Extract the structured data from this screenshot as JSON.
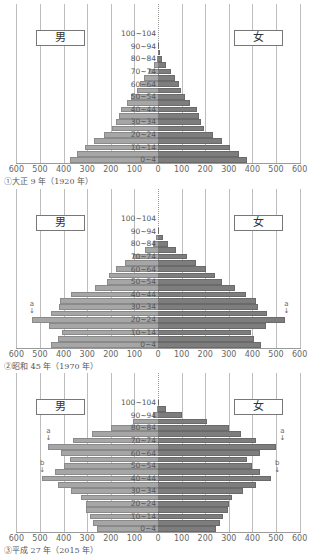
{
  "chart_data": [
    {
      "type": "bar",
      "subtype": "population-pyramid",
      "title": "①大正9年（1920年）",
      "unit": "万人 (implied, 10 thousand persons)",
      "xlabel": "",
      "ylabel": "",
      "x_ticks": [
        600,
        500,
        400,
        300,
        200,
        100,
        0,
        100,
        200,
        300,
        400,
        500,
        600
      ],
      "xlim": [
        -600,
        600
      ],
      "age_labels_shown": [
        "100~104",
        "90~94",
        "80~84",
        "70~74",
        "60~64",
        "50~54",
        "40~44",
        "30~34",
        "20~24",
        "10~14",
        "0~4"
      ],
      "categories": [
        "0~4",
        "5~9",
        "10~14",
        "15~19",
        "20~24",
        "25~29",
        "30~34",
        "35~39",
        "40~44",
        "45~49",
        "50~54",
        "55~59",
        "60~64",
        "65~69",
        "70~74",
        "75~79",
        "80~84",
        "85~89",
        "90~94",
        "95~99",
        "100~104"
      ],
      "series": [
        {
          "name": "男",
          "color": "#a6a6a6",
          "values": [
            373,
            343,
            309,
            271,
            229,
            195,
            178,
            165,
            157,
            131,
            114,
            89,
            76,
            59,
            38,
            17,
            6,
            2,
            0,
            0,
            0
          ]
        },
        {
          "name": "女",
          "color": "#7d7d7d",
          "values": [
            377,
            343,
            305,
            271,
            233,
            195,
            182,
            174,
            165,
            136,
            114,
            97,
            89,
            72,
            55,
            34,
            17,
            8,
            2,
            0,
            0
          ]
        }
      ],
      "legend": [
        "男",
        "女"
      ],
      "annotations": []
    },
    {
      "type": "bar",
      "subtype": "population-pyramid",
      "title": "②昭和45年（1970年）",
      "x_ticks": [
        600,
        500,
        400,
        300,
        200,
        100,
        0,
        100,
        200,
        300,
        400,
        500,
        600
      ],
      "xlim": [
        -600,
        600
      ],
      "categories": [
        "0~4",
        "5~9",
        "10~14",
        "15~19",
        "20~24",
        "25~29",
        "30~34",
        "35~39",
        "40~44",
        "45~49",
        "50~54",
        "55~59",
        "60~64",
        "65~69",
        "70~74",
        "75~79",
        "80~84",
        "85~89",
        "90~94",
        "95~99",
        "100~104"
      ],
      "series": [
        {
          "name": "男",
          "color": "#a6a6a6",
          "values": [
            455,
            423,
            407,
            462,
            534,
            453,
            421,
            415,
            367,
            267,
            214,
            206,
            176,
            141,
            107,
            55,
            23,
            8,
            2,
            0,
            0
          ]
        },
        {
          "name": "女",
          "color": "#7d7d7d",
          "values": [
            436,
            406,
            392,
            456,
            540,
            463,
            425,
            415,
            373,
            326,
            270,
            243,
            202,
            163,
            121,
            76,
            44,
            23,
            6,
            0,
            0
          ]
        }
      ],
      "legend": [
        "男",
        "女"
      ],
      "annotations": [
        {
          "label": "a",
          "side": "男",
          "age": "20~24"
        },
        {
          "label": "a",
          "side": "女",
          "age": "20~24"
        }
      ]
    },
    {
      "type": "bar",
      "subtype": "population-pyramid",
      "title": "③平成27年（2015年）",
      "x_ticks": [
        600,
        500,
        400,
        300,
        200,
        100,
        0,
        100,
        200,
        300,
        400,
        500,
        600
      ],
      "xlim": [
        -600,
        600
      ],
      "categories": [
        "0~4",
        "5~9",
        "10~14",
        "15~19",
        "20~24",
        "25~29",
        "30~34",
        "35~39",
        "40~44",
        "45~49",
        "50~54",
        "55~59",
        "60~64",
        "65~69",
        "70~74",
        "75~79",
        "80~84",
        "85~89",
        "90~94",
        "95~99",
        "100~104"
      ],
      "series": [
        {
          "name": "男",
          "color": "#a6a6a6",
          "values": [
            258,
            275,
            288,
            306,
            303,
            325,
            367,
            422,
            490,
            437,
            399,
            372,
            412,
            464,
            359,
            278,
            200,
            105,
            23,
            4,
            0
          ]
        },
        {
          "name": "女",
          "color": "#7d7d7d",
          "values": [
            246,
            263,
            277,
            295,
            299,
            315,
            362,
            414,
            480,
            432,
            398,
            379,
            431,
            502,
            415,
            350,
            301,
            206,
            101,
            32,
            4
          ]
        }
      ],
      "legend": [
        "男",
        "女"
      ],
      "annotations": [
        {
          "label": "a",
          "side": "男",
          "age": "65~69"
        },
        {
          "label": "a",
          "side": "女",
          "age": "65~69"
        },
        {
          "label": "b",
          "side": "男",
          "age": "40~44"
        },
        {
          "label": "b",
          "side": "女",
          "age": "40~44"
        }
      ]
    }
  ],
  "labels": {
    "male": "男",
    "female": "女"
  },
  "captions": [
    "①大正 9 年（1920 年）",
    "②昭和 45 年（1970 年）",
    "③平成 27 年（2015 年）"
  ]
}
